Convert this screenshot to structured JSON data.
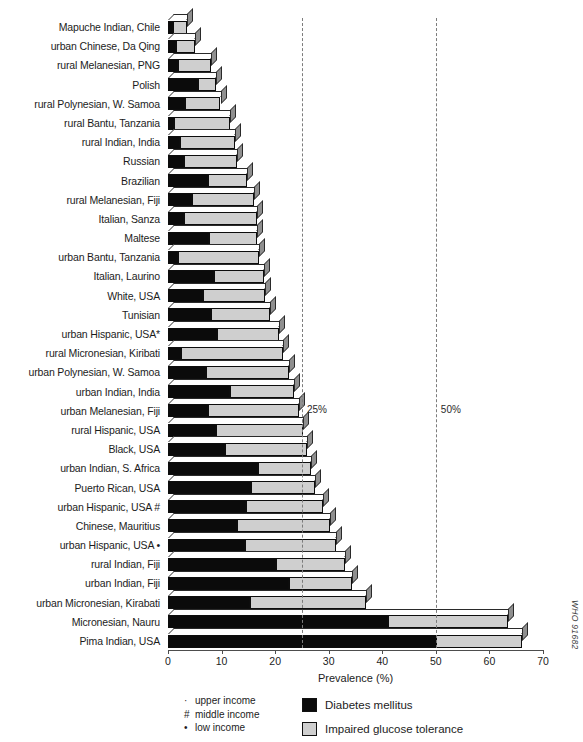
{
  "chart_data": {
    "type": "bar",
    "orientation": "horizontal",
    "stacked": true,
    "title": "",
    "xlabel": "Prevalence (%)",
    "ylabel": "",
    "xlim": [
      0,
      70
    ],
    "xticks": [
      0,
      10,
      20,
      30,
      40,
      50,
      60,
      70
    ],
    "grid": false,
    "legend_position": "bottom",
    "categories": [
      "Mapuche Indian, Chile",
      "urban Chinese, Da Qing",
      "rural Melanesian, PNG",
      "Polish",
      "rural Polynesian, W. Samoa",
      "rural Bantu, Tanzania",
      "rural Indian, India",
      "Russian",
      "Brazilian",
      "rural Melanesian, Fiji",
      "Italian, Sanza",
      "Maltese",
      "urban Bantu, Tanzania",
      "Italian, Laurino",
      "White, USA",
      "Tunisian",
      "urban Hispanic, USA*",
      "rural Micronesian, Kiribati",
      "urban Polynesian, W. Samoa",
      "urban Indian, India",
      "urban Melanesian, Fiji",
      "rural Hispanic, USA",
      "Black, USA",
      "urban Indian, S. Africa",
      "Puerto Rican, USA",
      "urban Hispanic, USA #",
      "Chinese, Mauritius",
      "urban Hispanic, USA •",
      "rural Indian, Fiji",
      "urban Indian, Fiji",
      "urban Micronesian, Kirabati",
      "Micronesian, Nauru",
      "Pima Indian, USA"
    ],
    "series": [
      {
        "name": "Diabetes mellitus",
        "color": "#0b0b0b",
        "values": [
          1.0,
          1.5,
          1.8,
          5.6,
          3.2,
          1.1,
          2.3,
          3.0,
          7.4,
          4.5,
          3.0,
          7.7,
          1.8,
          8.5,
          6.5,
          8.0,
          9.2,
          2.4,
          7.0,
          11.5,
          7.5,
          9.0,
          10.6,
          16.8,
          15.5,
          14.5,
          12.8,
          14.3,
          20.2,
          22.5,
          15.3,
          41.0,
          50.0
        ]
      },
      {
        "name": "Impaired glucose tolerance",
        "color": "#cfcfcf",
        "values": [
          2.6,
          3.5,
          6.3,
          3.4,
          6.6,
          10.4,
          10.2,
          9.8,
          7.4,
          11.6,
          13.6,
          9.0,
          15.2,
          9.4,
          11.6,
          11.0,
          11.5,
          19.0,
          15.6,
          12.0,
          17.0,
          16.2,
          15.3,
          9.8,
          12.0,
          14.5,
          17.5,
          17.0,
          12.8,
          11.8,
          21.7,
          22.5,
          16.0
        ]
      }
    ],
    "reference_lines": [
      {
        "label": "25%",
        "value": 25
      },
      {
        "label": "50%",
        "value": 50
      }
    ]
  },
  "axis": {
    "xlabel": "Prevalence (%)",
    "ticks": [
      "0",
      "10",
      "20",
      "30",
      "40",
      "50",
      "60",
      "70"
    ]
  },
  "legend": {
    "income": [
      {
        "symbol": "·",
        "label": "upper income"
      },
      {
        "symbol": "#",
        "label": "middle income"
      },
      {
        "symbol": "•",
        "label": "low income"
      }
    ],
    "series": [
      {
        "label": "Diabetes mellitus",
        "color": "#0b0b0b"
      },
      {
        "label": "Impaired glucose tolerance",
        "color": "#cfcfcf"
      }
    ]
  },
  "annotations": {
    "who_code": "WHO 91682",
    "ref_25": "25%",
    "ref_50": "50%"
  },
  "caption": ""
}
